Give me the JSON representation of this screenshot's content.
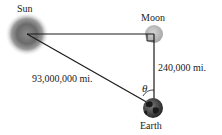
{
  "diagram": {
    "type": "right-triangle astronomy diagram",
    "bodies": {
      "sun": {
        "label": "Sun"
      },
      "moon": {
        "label": "Moon"
      },
      "earth": {
        "label": "Earth"
      }
    },
    "distances": {
      "sun_to_earth": "93,000,000 mi.",
      "moon_to_earth": "240,000 mi."
    },
    "angle": {
      "label": "θ",
      "at": "Earth"
    },
    "right_angle_at": "Moon",
    "colors": {
      "line": "#1a1a1a",
      "sun_core": "#6e6e6e",
      "sun_glow": "#bdbdbd",
      "moon": "#b5b5b5",
      "earth_dark": "#2a2a2a",
      "earth_light": "#8a8a8a",
      "text": "#222222"
    }
  }
}
